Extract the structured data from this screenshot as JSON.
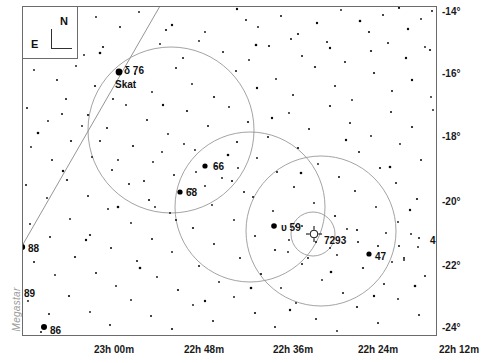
{
  "app": {
    "watermark": "Megastar"
  },
  "compass": {
    "north_label": "N",
    "east_label": "E"
  },
  "axes": {
    "dec_unit": "°",
    "dec_labels": [
      "-14°",
      "-16°",
      "-18°",
      "-20°",
      "-22°",
      "-24°"
    ],
    "ra_labels": [
      "23h 00m",
      "22h 48m",
      "22h 36m",
      "22h 24m",
      "22h 12m"
    ]
  },
  "labels": {
    "delta": "δ  76",
    "skat": "Skat",
    "s66": "66",
    "s68": "68",
    "s88": "88",
    "s89": "89",
    "s86": "86",
    "ups59": "υ  59",
    "ngc7293": "7293",
    "s47": "47",
    "s41": "41"
  },
  "chart_data": {
    "type": "scatter",
    "title": "",
    "xlabel": "Right Ascension",
    "ylabel": "Declination",
    "xlim": [
      23.05,
      22.1
    ],
    "ylim": [
      -24.8,
      -13.6
    ],
    "grid": false,
    "legend": false,
    "x_ticks": [
      "23h 00m",
      "22h 48m",
      "22h 36m",
      "22h 24m",
      "22h 12m"
    ],
    "y_ticks": [
      "-14°",
      "-16°",
      "-18°",
      "-20°",
      "-22°",
      "-24°"
    ],
    "annotations": [
      {
        "label": "δ  76",
        "x": 124,
        "y": 65,
        "kind": "star-name"
      },
      {
        "label": "Skat",
        "x": 115,
        "y": 79,
        "kind": "star-name"
      },
      {
        "label": "66",
        "x": 213,
        "y": 161,
        "kind": "star-number"
      },
      {
        "label": "68",
        "x": 186,
        "y": 187,
        "kind": "star-number"
      },
      {
        "label": "88",
        "x": 28,
        "y": 243,
        "kind": "star-number"
      },
      {
        "label": "89",
        "x": 24,
        "y": 288,
        "kind": "star-number"
      },
      {
        "label": "86",
        "x": 50,
        "y": 325,
        "kind": "star-number"
      },
      {
        "label": "υ  59",
        "x": 281,
        "y": 222,
        "kind": "star-name"
      },
      {
        "label": "7293",
        "x": 324,
        "y": 235,
        "kind": "deepsky-number"
      },
      {
        "label": "47",
        "x": 375,
        "y": 251,
        "kind": "star-number"
      },
      {
        "label": "41",
        "x": 430,
        "y": 235,
        "kind": "star-number"
      }
    ],
    "named_stars": [
      {
        "name": "δ Aqr (76) Skat",
        "x": 119,
        "y": 72,
        "mag_r": 3.4
      },
      {
        "name": "66 Aqr",
        "x": 205,
        "y": 166,
        "mag_r": 2.6
      },
      {
        "name": "68 Aqr",
        "x": 180,
        "y": 192,
        "mag_r": 2.6
      },
      {
        "name": "88 Aqr",
        "x": 22,
        "y": 247,
        "mag_r": 3.2
      },
      {
        "name": "89 Aqr",
        "x": 20,
        "y": 291,
        "mag_r": 2.6
      },
      {
        "name": "86 Aqr",
        "x": 44,
        "y": 327,
        "mag_r": 3.0
      },
      {
        "name": "υ Aqr (59)",
        "x": 274,
        "y": 226,
        "mag_r": 2.8
      },
      {
        "name": "47 Aqr",
        "x": 369,
        "y": 254,
        "mag_r": 2.6
      }
    ],
    "deep_sky": [
      {
        "name": "NGC 7293 Helix Nebula",
        "symbol": "planetary-nebula",
        "x": 314,
        "y": 234,
        "r": 7
      }
    ],
    "field_circles": [
      {
        "cx": 171,
        "cy": 130,
        "r": 83
      },
      {
        "cx": 250,
        "cy": 207,
        "r": 75
      },
      {
        "cx": 321,
        "cy": 231,
        "r": 75
      },
      {
        "cx": 313,
        "cy": 234,
        "r": 22
      }
    ],
    "constellation_lines": [
      {
        "x1": 22,
        "y1": 246,
        "x2": 160,
        "y2": 6
      }
    ],
    "stars": [
      [
        60,
        12,
        1.0
      ],
      [
        74,
        22,
        1.0
      ],
      [
        96,
        17,
        0.9
      ],
      [
        120,
        27,
        1.0
      ],
      [
        139,
        12,
        0.9
      ],
      [
        166,
        30,
        1.1
      ],
      [
        205,
        32,
        0.9
      ],
      [
        237,
        9,
        1.2
      ],
      [
        246,
        20,
        1.0
      ],
      [
        258,
        27,
        0.9
      ],
      [
        281,
        16,
        1.0
      ],
      [
        298,
        34,
        1.1
      ],
      [
        317,
        23,
        1.2
      ],
      [
        341,
        10,
        0.9
      ],
      [
        360,
        21,
        1.3
      ],
      [
        369,
        32,
        1.1
      ],
      [
        383,
        15,
        1.0
      ],
      [
        399,
        8,
        1.1
      ],
      [
        408,
        29,
        1.2
      ],
      [
        421,
        19,
        0.9
      ],
      [
        432,
        11,
        1.0
      ],
      [
        447,
        25,
        0.9
      ],
      [
        291,
        39,
        1.0
      ],
      [
        327,
        42,
        1.0
      ],
      [
        59,
        43,
        1.0
      ],
      [
        84,
        55,
        0.9
      ],
      [
        103,
        47,
        1.1
      ],
      [
        160,
        44,
        0.9
      ],
      [
        183,
        58,
        1.0
      ],
      [
        199,
        41,
        0.9
      ],
      [
        223,
        52,
        1.0
      ],
      [
        249,
        60,
        0.9
      ],
      [
        269,
        46,
        1.1
      ],
      [
        302,
        56,
        1.0
      ],
      [
        330,
        48,
        1.2
      ],
      [
        345,
        62,
        1.0
      ],
      [
        371,
        51,
        1.1
      ],
      [
        388,
        43,
        1.0
      ],
      [
        406,
        58,
        1.2
      ],
      [
        425,
        47,
        0.9
      ],
      [
        441,
        60,
        1.0
      ],
      [
        455,
        38,
        0.9
      ],
      [
        430,
        50,
        1.1
      ],
      [
        438,
        66,
        1.0
      ],
      [
        34,
        70,
        0.9
      ],
      [
        57,
        80,
        1.0
      ],
      [
        76,
        66,
        0.9
      ],
      [
        95,
        86,
        1.1
      ],
      [
        113,
        99,
        1.0
      ],
      [
        135,
        74,
        1.0
      ],
      [
        152,
        92,
        0.9
      ],
      [
        176,
        68,
        1.0
      ],
      [
        192,
        84,
        0.9
      ],
      [
        214,
        97,
        1.1
      ],
      [
        236,
        71,
        1.0
      ],
      [
        257,
        88,
        1.2
      ],
      [
        276,
        79,
        0.9
      ],
      [
        293,
        95,
        1.0
      ],
      [
        315,
        67,
        1.1
      ],
      [
        335,
        86,
        1.0
      ],
      [
        352,
        100,
        0.9
      ],
      [
        374,
        73,
        1.1
      ],
      [
        392,
        91,
        1.0
      ],
      [
        412,
        80,
        1.2
      ],
      [
        431,
        97,
        0.9
      ],
      [
        450,
        71,
        1.0
      ],
      [
        463,
        88,
        1.0
      ],
      [
        27,
        108,
        1.0
      ],
      [
        48,
        121,
        0.9
      ],
      [
        66,
        99,
        1.0
      ],
      [
        88,
        115,
        1.1
      ],
      [
        107,
        128,
        1.0
      ],
      [
        126,
        105,
        0.9
      ],
      [
        147,
        120,
        1.0
      ],
      [
        168,
        134,
        0.9
      ],
      [
        187,
        111,
        1.1
      ],
      [
        208,
        126,
        1.0
      ],
      [
        229,
        107,
        0.9
      ],
      [
        248,
        122,
        1.1
      ],
      [
        268,
        137,
        1.0
      ],
      [
        289,
        113,
        0.9
      ],
      [
        309,
        129,
        1.0
      ],
      [
        330,
        106,
        1.1
      ],
      [
        350,
        123,
        1.0
      ],
      [
        371,
        136,
        0.9
      ],
      [
        391,
        112,
        1.0
      ],
      [
        412,
        127,
        1.1
      ],
      [
        433,
        110,
        0.9
      ],
      [
        452,
        125,
        1.0
      ],
      [
        464,
        107,
        0.9
      ],
      [
        31,
        147,
        0.9
      ],
      [
        52,
        160,
        1.0
      ],
      [
        71,
        141,
        1.1
      ],
      [
        92,
        157,
        0.9
      ],
      [
        112,
        170,
        1.0
      ],
      [
        133,
        146,
        1.1
      ],
      [
        153,
        162,
        0.9
      ],
      [
        174,
        175,
        1.0
      ],
      [
        195,
        150,
        0.9
      ],
      [
        216,
        166,
        1.0
      ],
      [
        237,
        142,
        1.1
      ],
      [
        257,
        158,
        0.9
      ],
      [
        277,
        172,
        1.0
      ],
      [
        298,
        148,
        1.1
      ],
      [
        318,
        164,
        0.9
      ],
      [
        339,
        177,
        1.0
      ],
      [
        359,
        152,
        1.0
      ],
      [
        380,
        168,
        1.1
      ],
      [
        400,
        144,
        0.9
      ],
      [
        421,
        160,
        1.0
      ],
      [
        441,
        174,
        0.9
      ],
      [
        459,
        150,
        1.0
      ],
      [
        467,
        166,
        0.9
      ],
      [
        26,
        185,
        1.0
      ],
      [
        47,
        198,
        0.9
      ],
      [
        67,
        180,
        1.1
      ],
      [
        88,
        196,
        1.0
      ],
      [
        108,
        209,
        0.9
      ],
      [
        129,
        184,
        1.0
      ],
      [
        149,
        200,
        1.1
      ],
      [
        170,
        213,
        0.9
      ],
      [
        191,
        189,
        1.0
      ],
      [
        212,
        205,
        0.9
      ],
      [
        232,
        181,
        1.1
      ],
      [
        253,
        197,
        1.0
      ],
      [
        273,
        211,
        0.9
      ],
      [
        294,
        187,
        1.0
      ],
      [
        314,
        203,
        0.9
      ],
      [
        335,
        216,
        1.1
      ],
      [
        355,
        191,
        1.0
      ],
      [
        376,
        207,
        0.9
      ],
      [
        396,
        183,
        1.0
      ],
      [
        417,
        199,
        1.1
      ],
      [
        437,
        212,
        0.9
      ],
      [
        456,
        188,
        1.0
      ],
      [
        466,
        204,
        1.0
      ],
      [
        30,
        224,
        0.9
      ],
      [
        50,
        237,
        1.0
      ],
      [
        70,
        219,
        0.9
      ],
      [
        90,
        235,
        1.1
      ],
      [
        111,
        248,
        1.0
      ],
      [
        131,
        223,
        0.9
      ],
      [
        152,
        239,
        1.0
      ],
      [
        172,
        252,
        0.9
      ],
      [
        193,
        228,
        1.1
      ],
      [
        214,
        244,
        1.0
      ],
      [
        234,
        220,
        0.9
      ],
      [
        255,
        236,
        1.0
      ],
      [
        275,
        250,
        1.1
      ],
      [
        296,
        226,
        0.9
      ],
      [
        316,
        242,
        1.0
      ],
      [
        337,
        255,
        0.9
      ],
      [
        357,
        230,
        1.1
      ],
      [
        378,
        246,
        1.0
      ],
      [
        398,
        222,
        0.9
      ],
      [
        419,
        238,
        1.0
      ],
      [
        439,
        251,
        1.1
      ],
      [
        458,
        227,
        0.9
      ],
      [
        468,
        243,
        1.0
      ],
      [
        34,
        262,
        1.0
      ],
      [
        55,
        275,
        0.9
      ],
      [
        75,
        257,
        1.1
      ],
      [
        96,
        273,
        1.0
      ],
      [
        116,
        286,
        0.9
      ],
      [
        137,
        261,
        1.0
      ],
      [
        157,
        277,
        0.9
      ],
      [
        178,
        290,
        1.1
      ],
      [
        199,
        266,
        1.0
      ],
      [
        219,
        282,
        0.9
      ],
      [
        240,
        258,
        1.0
      ],
      [
        261,
        274,
        1.1
      ],
      [
        281,
        288,
        0.9
      ],
      [
        302,
        264,
        1.0
      ],
      [
        322,
        280,
        0.9
      ],
      [
        343,
        293,
        1.0
      ],
      [
        363,
        268,
        1.1
      ],
      [
        384,
        284,
        1.0
      ],
      [
        404,
        260,
        0.9
      ],
      [
        425,
        276,
        1.0
      ],
      [
        445,
        289,
        0.9
      ],
      [
        461,
        265,
        1.0
      ],
      [
        28,
        301,
        0.9
      ],
      [
        49,
        314,
        1.0
      ],
      [
        69,
        296,
        1.1
      ],
      [
        90,
        312,
        0.9
      ],
      [
        110,
        325,
        1.0
      ],
      [
        131,
        300,
        0.9
      ],
      [
        151,
        316,
        1.0
      ],
      [
        172,
        329,
        1.1
      ],
      [
        193,
        305,
        0.9
      ],
      [
        213,
        321,
        1.0
      ],
      [
        234,
        297,
        0.9
      ],
      [
        255,
        313,
        1.1
      ],
      [
        275,
        327,
        1.0
      ],
      [
        296,
        303,
        0.9
      ],
      [
        316,
        319,
        1.0
      ],
      [
        337,
        331,
        0.9
      ],
      [
        357,
        307,
        1.1
      ],
      [
        378,
        323,
        1.0
      ],
      [
        398,
        299,
        0.9
      ],
      [
        419,
        315,
        1.0
      ],
      [
        439,
        328,
        1.1
      ],
      [
        458,
        304,
        0.9
      ],
      [
        466,
        320,
        1.0
      ],
      [
        41,
        332,
        1.0
      ],
      [
        62,
        340,
        0.9
      ],
      [
        103,
        338,
        1.0
      ],
      [
        145,
        344,
        0.9
      ],
      [
        186,
        336,
        1.0
      ],
      [
        225,
        345,
        0.9
      ],
      [
        264,
        339,
        1.0
      ],
      [
        305,
        347,
        0.9
      ],
      [
        347,
        337,
        1.0
      ],
      [
        389,
        346,
        0.9
      ],
      [
        430,
        340,
        1.0
      ],
      [
        18,
        93,
        1.4
      ],
      [
        38,
        133,
        1.3
      ],
      [
        63,
        171,
        1.2
      ],
      [
        118,
        207,
        1.3
      ],
      [
        163,
        105,
        1.2
      ],
      [
        228,
        155,
        1.3
      ],
      [
        272,
        118,
        1.2
      ],
      [
        301,
        173,
        1.3
      ],
      [
        346,
        140,
        1.2
      ],
      [
        390,
        167,
        1.3
      ],
      [
        410,
        210,
        1.2
      ],
      [
        448,
        143,
        1.3
      ],
      [
        86,
        240,
        1.2
      ],
      [
        140,
        268,
        1.3
      ],
      [
        205,
        301,
        1.2
      ],
      [
        251,
        288,
        1.3
      ],
      [
        290,
        310,
        1.2
      ],
      [
        331,
        272,
        1.3
      ],
      [
        374,
        296,
        1.2
      ],
      [
        415,
        286,
        1.3
      ],
      [
        452,
        312,
        1.2
      ],
      [
        100,
        53,
        1.3
      ],
      [
        172,
        25,
        1.2
      ],
      [
        256,
        45,
        1.3
      ],
      [
        302,
        226,
        0.9
      ],
      [
        289,
        240,
        0.9
      ],
      [
        330,
        248,
        0.9
      ],
      [
        308,
        258,
        1.0
      ],
      [
        288,
        252,
        0.9
      ],
      [
        347,
        229,
        0.9
      ],
      [
        358,
        242,
        1.0
      ],
      [
        386,
        233,
        0.9
      ],
      [
        399,
        246,
        1.0
      ],
      [
        411,
        234,
        0.9
      ],
      [
        418,
        247,
        0.9
      ],
      [
        404,
        258,
        1.0
      ],
      [
        392,
        262,
        0.9
      ],
      [
        205,
        186,
        0.9
      ],
      [
        222,
        178,
        0.9
      ],
      [
        196,
        172,
        0.9
      ],
      [
        238,
        168,
        0.9
      ],
      [
        244,
        192,
        1.0
      ],
      [
        162,
        152,
        0.9
      ],
      [
        184,
        144,
        0.9
      ],
      [
        144,
        181,
        1.0
      ],
      [
        155,
        207,
        0.9
      ],
      [
        176,
        220,
        1.0
      ],
      [
        118,
        160,
        0.9
      ],
      [
        100,
        141,
        1.0
      ],
      [
        82,
        126,
        0.9
      ],
      [
        62,
        114,
        1.0
      ]
    ]
  }
}
